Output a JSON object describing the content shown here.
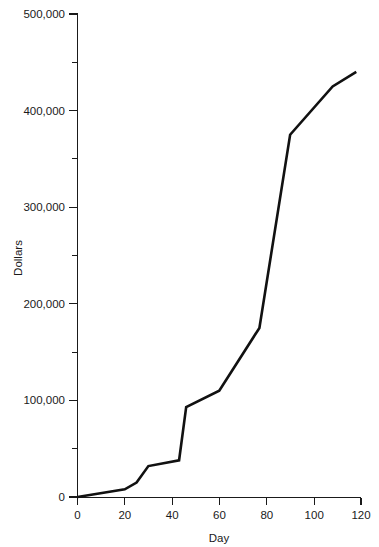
{
  "chart_data": {
    "type": "line",
    "title": "",
    "xlabel": "Day",
    "ylabel": "Dollars",
    "xlim": [
      0,
      120
    ],
    "ylim": [
      0,
      500000
    ],
    "grid": false,
    "legend": null,
    "x_ticks": [
      0,
      20,
      40,
      60,
      80,
      100,
      120
    ],
    "x_tick_labels": [
      "0",
      "20",
      "40",
      "60",
      "80",
      "100",
      "120"
    ],
    "y_ticks": [
      0,
      100000,
      200000,
      300000,
      400000,
      500000
    ],
    "y_tick_labels": [
      "0",
      "100,000",
      "200,000",
      "300,000",
      "400,000",
      "500,000"
    ],
    "y_minor_ticks": [
      50000,
      150000,
      250000,
      350000,
      450000
    ],
    "series": [
      {
        "name": "Cumulative Dollars",
        "color": "#111111",
        "x": [
          0,
          20,
          25,
          30,
          43,
          46,
          60,
          77,
          90,
          108,
          118
        ],
        "values": [
          0,
          8000,
          15000,
          32000,
          38000,
          93000,
          110000,
          175000,
          375000,
          425000,
          440000
        ]
      }
    ]
  },
  "axes": {
    "x_title": "Day",
    "y_title": "Dollars"
  },
  "colors": {
    "line": "#111111",
    "axis": "#1a1a1a",
    "background": "#ffffff"
  }
}
